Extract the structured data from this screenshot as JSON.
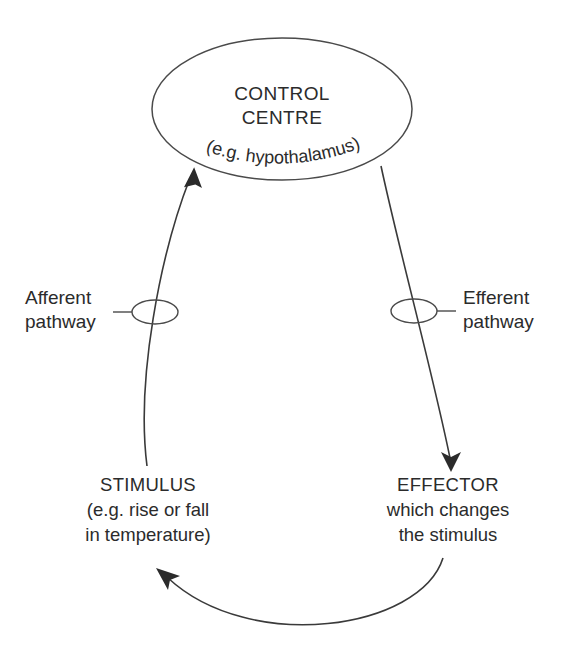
{
  "diagram": {
    "title_semantic": "negative-feedback-homeostasis-loop",
    "background_color": "#ffffff",
    "ink_color": "#2b2b2b",
    "line_color": "#3a3a3a",
    "control_centre": {
      "line1": "CONTROL",
      "line2": "CENTRE",
      "line3": "(e.g. hypothalamus)"
    },
    "afferent": {
      "line1": "Afferent",
      "line2": "pathway"
    },
    "efferent": {
      "line1": "Efferent",
      "line2": "pathway"
    },
    "stimulus": {
      "line1": "STIMULUS",
      "line2": "(e.g. rise or fall",
      "line3": "in temperature)"
    },
    "effector": {
      "line1": "EFFECTOR",
      "line2": "which changes",
      "line3": "the stimulus"
    }
  }
}
